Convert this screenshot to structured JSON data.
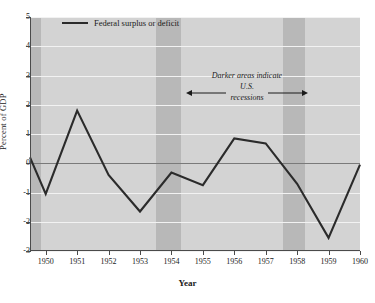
{
  "chart_data": {
    "type": "line",
    "title": "",
    "xlabel": "Year",
    "ylabel": "Percent of GDP",
    "xlim": [
      1949.5,
      1960
    ],
    "ylim": [
      -3,
      5
    ],
    "xticks": [
      1950,
      1951,
      1952,
      1953,
      1954,
      1955,
      1956,
      1957,
      1958,
      1959,
      1960
    ],
    "yticks": [
      -3,
      -2,
      -1,
      0,
      1,
      2,
      3,
      4,
      5
    ],
    "grid": "horizontal",
    "legend_position": "top-left",
    "series": [
      {
        "name": "Federal surplus or deficit",
        "color": "#2b2b2b",
        "x": [
          1949.5,
          1950,
          1951,
          1952,
          1953,
          1954,
          1955,
          1956,
          1957,
          1958,
          1959,
          1960
        ],
        "values": [
          0.2,
          -1.05,
          1.8,
          -0.4,
          -1.65,
          -0.32,
          -0.75,
          0.85,
          0.68,
          -0.7,
          -2.55,
          -0.05
        ]
      }
    ],
    "shaded_regions": [
      {
        "label": "U.S. recession",
        "start": 1949.5,
        "end": 1949.85,
        "color": "#b8b8b8"
      },
      {
        "label": "U.S. recession",
        "start": 1953.5,
        "end": 1954.3,
        "color": "#b8b8b8"
      },
      {
        "label": "U.S. recession",
        "start": 1957.55,
        "end": 1958.25,
        "color": "#b8b8b8"
      }
    ],
    "annotations": [
      {
        "line1": "Darker areas indicate",
        "line2": "U.S. recessions"
      }
    ],
    "plot_background": "#d3d3d3"
  },
  "axis": {
    "ylabel": "Percent of GDP",
    "xlabel": "Year",
    "ytick_labels": [
      "5",
      "4",
      "3",
      "2",
      "1",
      "0",
      "-1",
      "-2",
      "-3"
    ],
    "xtick_labels": [
      "1950",
      "1951",
      "1952",
      "1953",
      "1954",
      "1955",
      "1956",
      "1957",
      "1958",
      "1959",
      "1960"
    ]
  },
  "legend": {
    "entries": [
      {
        "label": "Federal surplus or deficit",
        "color": "#2b2b2b"
      }
    ]
  },
  "annotation": {
    "line1": "Darker areas indicate",
    "line2": "U.S. recessions",
    "arrow_left": "←",
    "arrow_right": "→"
  }
}
